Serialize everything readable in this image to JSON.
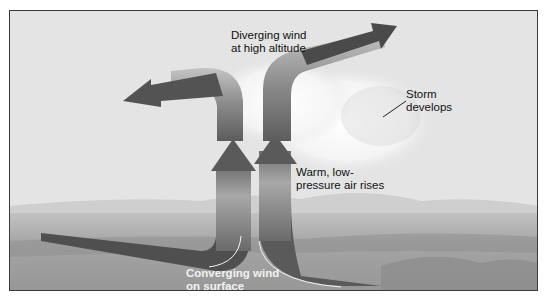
{
  "diagram": {
    "labels": {
      "diverging_line1": "Diverging wind",
      "diverging_line2": "at high altitude",
      "storm_line1": "Storm",
      "storm_line2": "develops",
      "warm_line1": "Warm, low-",
      "warm_line2": "pressure air rises",
      "converging_line1": "Converging wind",
      "converging_line2": "on surface"
    },
    "elements": [
      {
        "name": "left-air-current",
        "description": "Surface wind from left rises then diverges left at altitude"
      },
      {
        "name": "right-air-current",
        "description": "Surface wind from right rises then diverges right at altitude"
      },
      {
        "name": "storm-cloud",
        "description": "Cloud forming where air rises"
      },
      {
        "name": "landscape",
        "description": "Hills and plains in background"
      }
    ],
    "colors": {
      "arrow_dark": "#4a4a4a",
      "arrow_mid": "#7a7a7a",
      "arrow_light": "#b8b8b8",
      "sky": "#e6e6e6",
      "ground": "#a5a5a5",
      "frame": "#3a3a3a"
    }
  }
}
